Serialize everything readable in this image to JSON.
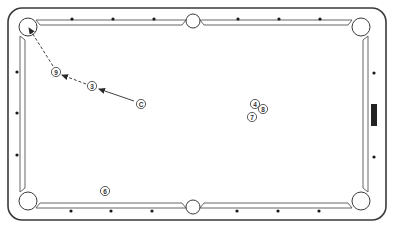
{
  "diagram": {
    "type": "pool-table-shot-diagram",
    "colors": {
      "line": "#3a3a3a",
      "background": "#ffffff",
      "diamond": "#1a1a1a",
      "marker": "#222222"
    },
    "table": {
      "outer": {
        "x": 8,
        "y": 8,
        "w": 378,
        "h": 212,
        "r": 14
      },
      "cushion": {
        "x": 22,
        "y": 22,
        "w": 348,
        "h": 184
      }
    },
    "pockets": [
      {
        "name": "top-left",
        "x": 28,
        "y": 27
      },
      {
        "name": "top-center",
        "x": 193,
        "y": 21
      },
      {
        "name": "top-right",
        "x": 361,
        "y": 27
      },
      {
        "name": "bottom-left",
        "x": 28,
        "y": 201
      },
      {
        "name": "bottom-center",
        "x": 193,
        "y": 207
      },
      {
        "name": "bottom-right",
        "x": 361,
        "y": 201
      }
    ],
    "diamonds": {
      "top": [
        {
          "x": 72,
          "y": 19
        },
        {
          "x": 113,
          "y": 19
        },
        {
          "x": 154,
          "y": 19
        },
        {
          "x": 238,
          "y": 19
        },
        {
          "x": 279,
          "y": 19
        },
        {
          "x": 320,
          "y": 19
        }
      ],
      "bottom": [
        {
          "x": 71,
          "y": 211
        },
        {
          "x": 111,
          "y": 211
        },
        {
          "x": 152,
          "y": 211
        },
        {
          "x": 237,
          "y": 211
        },
        {
          "x": 278,
          "y": 211
        },
        {
          "x": 319,
          "y": 211
        }
      ],
      "left": [
        {
          "x": 17,
          "y": 72
        },
        {
          "x": 17,
          "y": 113
        },
        {
          "x": 17,
          "y": 155
        }
      ],
      "right": [
        {
          "x": 374,
          "y": 73
        },
        {
          "x": 374,
          "y": 157
        }
      ]
    },
    "rail_marker": {
      "x": 371,
      "y": 104,
      "w": 6,
      "h": 22
    },
    "balls": [
      {
        "id": "cue",
        "label": "C",
        "x": 141,
        "y": 104
      },
      {
        "id": "ball-3",
        "label": "3",
        "x": 92,
        "y": 86
      },
      {
        "id": "ball-9",
        "label": "9",
        "x": 56,
        "y": 72
      },
      {
        "id": "ball-4",
        "label": "4",
        "x": 255,
        "y": 104
      },
      {
        "id": "ball-8",
        "label": "8",
        "x": 263,
        "y": 109
      },
      {
        "id": "ball-7",
        "label": "7",
        "x": 252,
        "y": 117
      },
      {
        "id": "ball-6",
        "label": "6",
        "x": 105,
        "y": 191
      }
    ],
    "shot_paths": [
      {
        "from": "cue",
        "to": "ball-3",
        "style": "solid",
        "x1": 134,
        "y1": 101,
        "x2": 99,
        "y2": 89
      },
      {
        "from": "ball-3",
        "to": "ball-9",
        "style": "dashed",
        "x1": 86,
        "y1": 84,
        "x2": 62,
        "y2": 75
      },
      {
        "from": "ball-9",
        "to": "top-left-pocket",
        "style": "dashed",
        "x1": 53,
        "y1": 66,
        "x2": 29,
        "y2": 28
      }
    ]
  }
}
